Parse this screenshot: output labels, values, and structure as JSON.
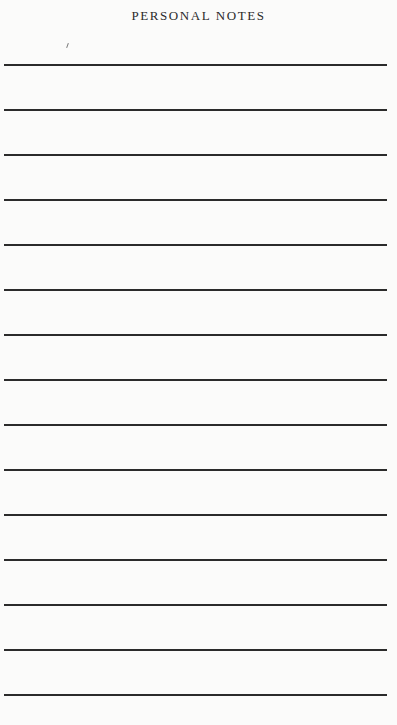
{
  "page": {
    "title": "PERSONAL NOTES",
    "ruled_lines": 15,
    "line_color": "#2b2b2b",
    "background_color": "#fbfbfa"
  }
}
